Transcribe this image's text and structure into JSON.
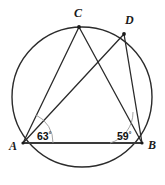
{
  "figure": {
    "type": "circle-geometry-diagram",
    "background_color": "#ffffff",
    "stroke_color": "#2b2b2b",
    "chord_color": "#3a3a3a",
    "arc_color": "#8c8c8c",
    "label_color": "#1a1a1a"
  },
  "circle": {
    "name": "circumcircle",
    "center_x": 82,
    "center_y": 97,
    "radius": 70,
    "stroke_width": 1.4
  },
  "points": [
    {
      "id": "A",
      "label": "A",
      "x": 23,
      "y": 143,
      "label_x": 9,
      "label_y": 150
    },
    {
      "id": "B",
      "label": "B",
      "x": 142,
      "y": 143,
      "label_x": 148,
      "label_y": 149
    },
    {
      "id": "C",
      "label": "C",
      "x": 79,
      "y": 27,
      "label_x": 74,
      "label_y": 17
    },
    {
      "id": "D",
      "label": "D",
      "x": 124,
      "y": 34,
      "label_x": 125,
      "label_y": 24
    }
  ],
  "segments": [
    {
      "id": "AB",
      "from": "A",
      "to": "B",
      "x1": 23,
      "y1": 143,
      "x2": 142,
      "y2": 143,
      "width": 2.2,
      "color": "#3a3a3a"
    },
    {
      "id": "AC",
      "from": "A",
      "to": "C",
      "x1": 23,
      "y1": 143,
      "x2": 79,
      "y2": 27,
      "width": 1.3,
      "color": "#2b2b2b"
    },
    {
      "id": "AD",
      "from": "A",
      "to": "D",
      "x1": 23,
      "y1": 143,
      "x2": 124,
      "y2": 34,
      "width": 1.3,
      "color": "#2b2b2b"
    },
    {
      "id": "BC",
      "from": "B",
      "to": "C",
      "x1": 142,
      "y1": 143,
      "x2": 79,
      "y2": 27,
      "width": 1.3,
      "color": "#2b2b2b"
    },
    {
      "id": "BD",
      "from": "B",
      "to": "D",
      "x1": 142,
      "y1": 143,
      "x2": 124,
      "y2": 34,
      "width": 1.3,
      "color": "#2b2b2b"
    }
  ],
  "angles": [
    {
      "id": "angle-A",
      "vertex": "A",
      "value": "63",
      "degree_symbol": "°",
      "full_label": "63°",
      "label_x": 37,
      "label_y": 139,
      "arc_path": "M 53 143 A 30 30 0 0 0 36 115",
      "arc_color": "#9a9a9a"
    },
    {
      "id": "angle-B",
      "vertex": "B",
      "value": "59",
      "degree_symbol": "°",
      "full_label": "59°",
      "label_x": 117,
      "label_y": 139,
      "arc_path": "M 110 143 A 32 32 0 0 0 133 112",
      "arc_color": "#9a9a9a"
    }
  ]
}
